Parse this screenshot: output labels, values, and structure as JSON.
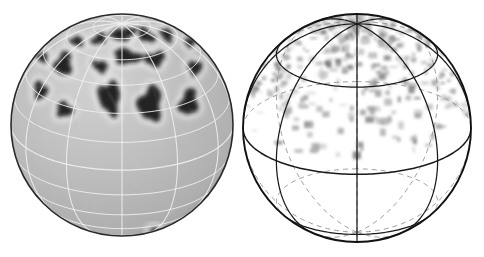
{
  "figure": {
    "title": "",
    "background_color": "#ffffff",
    "width": 484,
    "height": 257,
    "panel_count": 2
  },
  "panels": [
    {
      "id": "left-panel",
      "name": "shaded-sphere-with-dark-plumes",
      "label": "",
      "geometry": {
        "center_x": 122,
        "center_y": 125,
        "radius": 111,
        "tilt_deg": 24,
        "rotation_deg": 0
      },
      "style": {
        "surface_fill": "#b8b8b8",
        "surface_fill_light": "#c8c8c8",
        "limb_stroke": "#2a2a2a",
        "grid_stroke": "#f0f0f0",
        "grid_stroke_back": "#cfcfcf",
        "feature_fill": "#1a1a1a",
        "feature_halo": "#f2f2f2",
        "grid_visible": true,
        "grid_meridian_count": 12,
        "grid_parallel_count": 6
      },
      "features_label": "dark elongated plume structures concentrated in northern mid-latitudes and near the pole",
      "features": [
        {
          "lon": -8,
          "lat": 78,
          "rx": 11,
          "ry": 7,
          "rot": 18
        },
        {
          "lon": 22,
          "lat": 80,
          "rx": 10,
          "ry": 6,
          "rot": -25
        },
        {
          "lon": 52,
          "lat": 74,
          "rx": 13,
          "ry": 7,
          "rot": 40
        },
        {
          "lon": -42,
          "lat": 72,
          "rx": 10,
          "ry": 6,
          "rot": -30
        },
        {
          "lon": -68,
          "lat": 64,
          "rx": 9,
          "ry": 6,
          "rot": 10
        },
        {
          "lon": 82,
          "lat": 66,
          "rx": 11,
          "ry": 7,
          "rot": 55
        },
        {
          "lon": 6,
          "lat": 62,
          "rx": 16,
          "ry": 8,
          "rot": 8
        },
        {
          "lon": 34,
          "lat": 58,
          "rx": 12,
          "ry": 8,
          "rot": -12
        },
        {
          "lon": -20,
          "lat": 55,
          "rx": 9,
          "ry": 6,
          "rot": 25
        },
        {
          "lon": -55,
          "lat": 50,
          "rx": 10,
          "ry": 14,
          "rot": 12
        },
        {
          "lon": -60,
          "lat": 32,
          "rx": 8,
          "ry": 11,
          "rot": -8
        },
        {
          "lon": -36,
          "lat": 28,
          "rx": 9,
          "ry": 8,
          "rot": 30
        },
        {
          "lon": -8,
          "lat": 38,
          "rx": 11,
          "ry": 17,
          "rot": -5
        },
        {
          "lon": 18,
          "lat": 34,
          "rx": 12,
          "ry": 18,
          "rot": 6
        },
        {
          "lon": 44,
          "lat": 30,
          "rx": 10,
          "ry": 15,
          "rot": 14
        },
        {
          "lon": 66,
          "lat": 44,
          "rx": 9,
          "ry": 9,
          "rot": -20
        },
        {
          "lon": 96,
          "lat": 52,
          "rx": 8,
          "ry": 7,
          "rot": 0
        },
        {
          "lon": -85,
          "lat": 44,
          "rx": 8,
          "ry": 7,
          "rot": 0
        },
        {
          "lon": 34,
          "lat": -58,
          "rx": 7,
          "ry": 5,
          "rot": 20
        },
        {
          "lon": 5,
          "lat": -66,
          "rx": 8,
          "ry": 5,
          "rot": -15
        },
        {
          "lon": -26,
          "lat": -70,
          "rx": 7,
          "ry": 5,
          "rot": 25
        },
        {
          "lon": 58,
          "lat": -50,
          "rx": 6,
          "ry": 5,
          "rot": 0
        },
        {
          "lon": -55,
          "lat": -60,
          "rx": 6,
          "ry": 4,
          "rot": 10
        },
        {
          "lon": 74,
          "lat": -34,
          "rx": 5,
          "ry": 4,
          "rot": 0
        }
      ]
    },
    {
      "id": "right-panel",
      "name": "wireframe-sphere-with-gray-speckle",
      "label": "",
      "geometry": {
        "center_x": 357,
        "center_y": 128,
        "radius": 114,
        "tilt_deg": 24,
        "rotation_deg": 0
      },
      "style": {
        "surface_fill": "#ffffff",
        "limb_stroke": "#111111",
        "grid_front_stroke": "#1a1a1a",
        "grid_back_stroke": "#8e8e8e",
        "grid_back_dash": "5 4",
        "speckle_dark": "#6e6e6e",
        "speckle_mid": "#9a9a9a",
        "speckle_light": "#c4c4c4",
        "grid_visible": true,
        "grid_meridian_count": 8,
        "grid_parallel_count": 4
      },
      "features_label": "patchy gray shading confined to the northern hemisphere above the equator",
      "speckle_seed": 20240711,
      "speckle_band_lat_min": 8,
      "speckle_band_lat_max": 88,
      "speckle_count": 360
    }
  ],
  "legend": {
    "visible": false,
    "entries": []
  },
  "axes": {
    "visible": false
  },
  "annotations": []
}
